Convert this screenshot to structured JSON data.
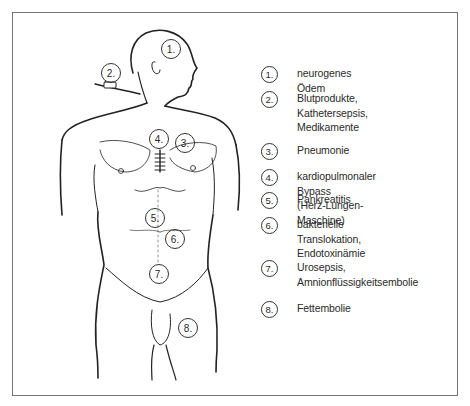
{
  "figure": {
    "markers": [
      {
        "num": "1.",
        "x": 171,
        "y": 49
      },
      {
        "num": "2.",
        "x": 111,
        "y": 73
      },
      {
        "num": "4.",
        "x": 159,
        "y": 139
      },
      {
        "num": "3.",
        "x": 185,
        "y": 143
      },
      {
        "num": "5.",
        "x": 155,
        "y": 218
      },
      {
        "num": "6.",
        "x": 175,
        "y": 239
      },
      {
        "num": "7.",
        "x": 159,
        "y": 274
      },
      {
        "num": "8.",
        "x": 188,
        "y": 328
      }
    ]
  },
  "legend": {
    "items": [
      {
        "num": "1.",
        "text": "neurogenes Ödem",
        "y": 66
      },
      {
        "num": "2.",
        "text": "Blutprodukte,\nKathetersepsis,\nMedikamente",
        "y": 91
      },
      {
        "num": "3.",
        "text": "Pneumonie",
        "y": 143
      },
      {
        "num": "4.",
        "text": "kardiopulmonaler Bypass\n(Herz-Lungen-Maschine)",
        "y": 169
      },
      {
        "num": "5.",
        "text": "Pankreatitis",
        "y": 192
      },
      {
        "num": "6.",
        "text": "bakterielle Translokation,\nEndotoxinämie",
        "y": 217
      },
      {
        "num": "7.",
        "text": "Urosepsis,\nAmnionflüssigkeitsembolie",
        "y": 260
      },
      {
        "num": "8.",
        "text": "Fettembolie",
        "y": 301
      }
    ]
  }
}
